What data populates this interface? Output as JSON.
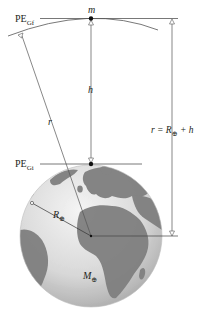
{
  "diagram": {
    "type": "gravitational-potential-energy",
    "labels": {
      "mass": "m",
      "height": "h",
      "radius_line": "r",
      "earth_radius": "R",
      "earth_mass": "M",
      "earth_symbol": "⊕",
      "pe_final": "PE",
      "pe_final_sub": "Gf",
      "pe_initial": "PE",
      "pe_initial_sub": "Gi",
      "r_equation_left": "r = R",
      "r_equation_right": " + h"
    },
    "colors": {
      "line": "#555555",
      "ocean": "#e6e6e6",
      "land": "#7d7d7d",
      "text": "#231f20"
    }
  }
}
